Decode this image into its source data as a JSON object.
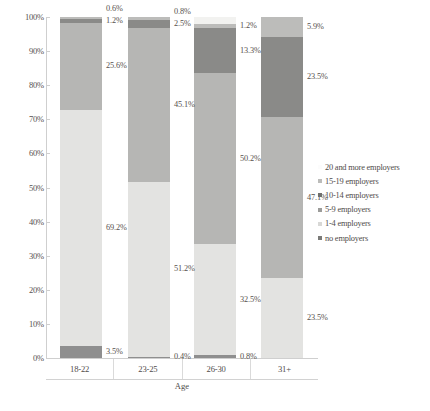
{
  "chart_data": {
    "type": "bar",
    "subtype": "stacked-100-percent",
    "title": "",
    "xlabel": "Age",
    "ylabel": "",
    "categories": [
      "18-22",
      "23-25",
      "26-30",
      "31+"
    ],
    "ylim": [
      0,
      100
    ],
    "ytick_labels": [
      "0%",
      "10%",
      "20%",
      "30%",
      "40%",
      "50%",
      "60%",
      "70%",
      "80%",
      "90%",
      "100%"
    ],
    "ytick_values": [
      0,
      10,
      20,
      30,
      40,
      50,
      60,
      70,
      80,
      90,
      100
    ],
    "grid": false,
    "legend_position": "right",
    "series": [
      {
        "name": "no employers",
        "color": "#8f8f8f",
        "values": [
          3.5,
          0.4,
          0.8,
          0.0
        ],
        "labels": [
          "3.5%",
          "0.4%",
          "0.8%",
          ""
        ]
      },
      {
        "name": "1-4 employers",
        "color": "#e3e3e1",
        "values": [
          69.2,
          51.2,
          32.5,
          23.5
        ],
        "labels": [
          "69.2%",
          "51.2%",
          "32.5%",
          "23.5%"
        ]
      },
      {
        "name": "5-9 employers",
        "color": "#b6b6b4",
        "values": [
          25.6,
          45.1,
          50.2,
          47.1
        ],
        "labels": [
          "25.6%",
          "45.1%",
          "50.2%",
          "47.1%"
        ]
      },
      {
        "name": "10-14 employers",
        "color": "#8a8a88",
        "values": [
          1.2,
          2.5,
          13.3,
          23.5
        ],
        "labels": [
          "1.2%",
          "2.5%",
          "13.3%",
          "23.5%"
        ]
      },
      {
        "name": "15-19 employers",
        "color": "#bcbcba",
        "values": [
          0.6,
          0.8,
          1.2,
          5.9
        ],
        "labels": [
          "0.6%",
          "0.8%",
          "1.2%",
          "5.9%"
        ]
      },
      {
        "name": "20 and more employers",
        "color": "#f2f2f0",
        "values": [
          0.0,
          0.0,
          2.0,
          0.0
        ],
        "labels": [
          "",
          "",
          "",
          ""
        ]
      }
    ]
  },
  "legend": {
    "items": [
      {
        "label": "20 and more employers",
        "color": "#f2f2f0"
      },
      {
        "label": "15-19 employers",
        "color": "#bcbcba"
      },
      {
        "label": "10-14 employers",
        "color": "#6f6f6d"
      },
      {
        "label": "5-9 employers",
        "color": "#9c9c9a"
      },
      {
        "label": "1-4 employers",
        "color": "#d8d8d6"
      },
      {
        "label": "no employers",
        "color": "#7a7a78"
      }
    ]
  },
  "axis": {
    "x_title": "Age"
  }
}
